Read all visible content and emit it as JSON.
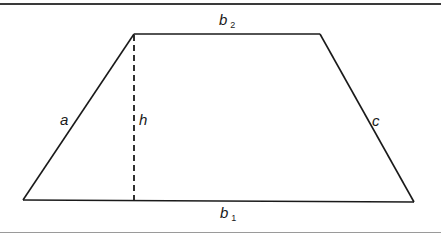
{
  "diagram": {
    "shape": "trapezoid",
    "colors": {
      "stroke": "#1a1a1a",
      "top_rule": "#3a3a3a",
      "bottom_rule": "#9a9a9a",
      "background": "#ffffff"
    },
    "vertices": {
      "top_left": [
        134,
        34
      ],
      "top_right": [
        320,
        34
      ],
      "bottom_right": [
        414,
        202
      ],
      "bottom_left": [
        23,
        200
      ]
    },
    "height_line": {
      "style": "dashed",
      "x": 134,
      "y1": 34,
      "y2": 201
    },
    "labels": {
      "b2": {
        "base": "b",
        "sub": "2"
      },
      "b1": {
        "base": "b",
        "sub": "1"
      },
      "a": {
        "text": "a"
      },
      "h": {
        "text": "h"
      },
      "c": {
        "text": "c"
      }
    }
  }
}
